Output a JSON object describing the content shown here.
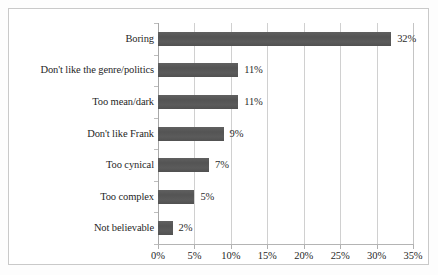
{
  "chart_data": {
    "type": "bar",
    "orientation": "horizontal",
    "title": "",
    "subtitle": "",
    "xlabel": "",
    "ylabel": "",
    "categories": [
      "Boring",
      "Don't like the genre/politics",
      "Too mean/dark",
      "Don't like Frank",
      "Too cynical",
      "Too complex",
      "Not believable"
    ],
    "values": [
      32,
      11,
      11,
      9,
      7,
      5,
      2
    ],
    "data_labels": [
      "32%",
      "11%",
      "11%",
      "9%",
      "7%",
      "5%",
      "2%"
    ],
    "xlim": [
      0,
      35
    ],
    "xticks": [
      0,
      5,
      10,
      15,
      20,
      25,
      30,
      35
    ],
    "xtick_labels": [
      "0%",
      "5%",
      "10%",
      "15%",
      "20%",
      "25%",
      "30%",
      "35%"
    ],
    "grid": "vertical",
    "legend": "none",
    "bar_color": "#585858",
    "gridline_color": "#d0d0d0",
    "axis_color": "#b0b0b0",
    "text_color": "#1f1f1f",
    "border_color": "#c9c9c9",
    "background_color": "#ffffff"
  }
}
